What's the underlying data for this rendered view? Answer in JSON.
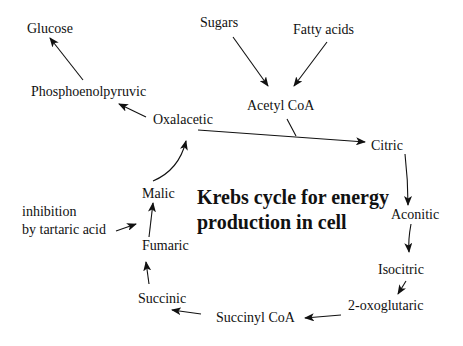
{
  "diagram": {
    "title_line1": "Krebs cycle for energy",
    "title_line2": "production in cell",
    "nodes": {
      "glucose": "Glucose",
      "sugars": "Sugars",
      "fatty_acids": "Fatty acids",
      "phosphoenolpyruvic": "Phosphoenolpyruvic",
      "acetyl_coa": "Acetyl CoA",
      "oxalacetic": "Oxalacetic",
      "citric": "Citric",
      "malic": "Malic",
      "aconitic": "Aconitic",
      "inhibition_line1": "inhibition",
      "inhibition_line2": "by tartaric acid",
      "fumaric": "Fumaric",
      "isocitric": "Isocitric",
      "succinic": "Succinic",
      "oxoglutaric": "2-oxoglutaric",
      "succinyl_coa": "Succinyl CoA"
    },
    "edges": [
      {
        "from": "Sugars",
        "to": "Acetyl CoA"
      },
      {
        "from": "Fatty acids",
        "to": "Acetyl CoA"
      },
      {
        "from": "Acetyl CoA",
        "to": "Oxalacetic-Citric reaction"
      },
      {
        "from": "Oxalacetic",
        "to": "Citric"
      },
      {
        "from": "Oxalacetic",
        "to": "Phosphoenolpyruvic"
      },
      {
        "from": "Phosphoenolpyruvic",
        "to": "Glucose"
      },
      {
        "from": "Citric",
        "to": "Aconitic"
      },
      {
        "from": "Aconitic",
        "to": "Isocitric"
      },
      {
        "from": "Isocitric",
        "to": "2-oxoglutaric"
      },
      {
        "from": "2-oxoglutaric",
        "to": "Succinyl CoA"
      },
      {
        "from": "Succinyl CoA",
        "to": "Succinic"
      },
      {
        "from": "Succinic",
        "to": "Fumaric"
      },
      {
        "from": "Fumaric",
        "to": "Malic"
      },
      {
        "from": "Malic",
        "to": "Oxalacetic"
      },
      {
        "from": "inhibition by tartaric acid",
        "to": "Fumaric-Malic step"
      }
    ],
    "colors": {
      "ink": "#111111",
      "background": "#ffffff"
    }
  }
}
